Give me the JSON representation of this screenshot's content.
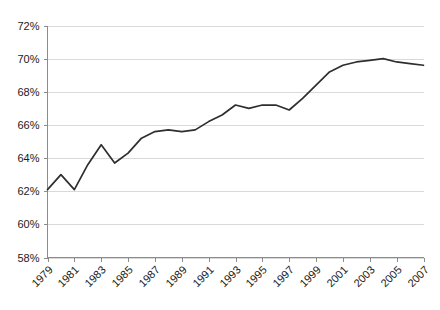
{
  "chart_data": {
    "type": "line",
    "title": "",
    "subtitle": "",
    "xlabel": "",
    "ylabel": "",
    "grid": true,
    "legend": false,
    "legend_position": "none",
    "line_color": "#2e2e2e",
    "grid_color": "#d9d9d9",
    "axis_color": "#8c8c8c",
    "background_color": "#ffffff",
    "xlim": [
      1979,
      2007
    ],
    "ylim": [
      58,
      72
    ],
    "ytick_step": 2,
    "xtick_step": 2,
    "x_tick_labels": [
      "1979",
      "1981",
      "1983",
      "1985",
      "1987",
      "1989",
      "1991",
      "1993",
      "1995",
      "1997",
      "1999",
      "2001",
      "2003",
      "2005",
      "2007"
    ],
    "y_tick_labels": [
      "58%",
      "60%",
      "62%",
      "64%",
      "66%",
      "68%",
      "70%",
      "72%"
    ],
    "x": [
      1979,
      1980,
      1981,
      1982,
      1983,
      1984,
      1985,
      1986,
      1987,
      1988,
      1989,
      1990,
      1991,
      1992,
      1993,
      1994,
      1995,
      1996,
      1997,
      1998,
      1999,
      2000,
      2001,
      2002,
      2003,
      2004,
      2005,
      2006,
      2007
    ],
    "values": [
      62.1,
      63.0,
      62.1,
      63.6,
      64.8,
      63.7,
      64.3,
      65.2,
      65.6,
      65.7,
      65.6,
      65.7,
      66.2,
      66.6,
      67.2,
      67.0,
      67.2,
      67.2,
      66.9,
      67.6,
      68.4,
      69.2,
      69.6,
      69.8,
      69.9,
      70.0,
      69.8,
      69.7,
      69.6
    ],
    "series": [
      {
        "name": "Percent",
        "values": [
          62.1,
          63.0,
          62.1,
          63.6,
          64.8,
          63.7,
          64.3,
          65.2,
          65.6,
          65.7,
          65.6,
          65.7,
          66.2,
          66.6,
          67.2,
          67.0,
          67.2,
          67.2,
          66.9,
          67.6,
          68.4,
          69.2,
          69.6,
          69.8,
          69.9,
          70.0,
          69.8,
          69.7,
          69.6
        ]
      }
    ]
  }
}
